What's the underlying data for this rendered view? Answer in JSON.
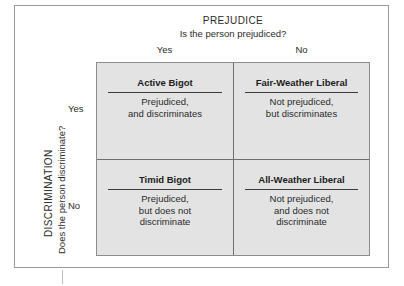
{
  "column_axis": {
    "name": "PREJUDICE",
    "question": "Is the person prejudiced?",
    "values": [
      "Yes",
      "No"
    ]
  },
  "row_axis": {
    "name": "DISCRIMINATION",
    "question": "Does the person discriminate?",
    "values": [
      "Yes",
      "No"
    ]
  },
  "cells": [
    {
      "title": "Active Bigot",
      "description_lines": [
        "Prejudiced,",
        "and discriminates"
      ]
    },
    {
      "title": "Fair-Weather Liberal",
      "description_lines": [
        "Not prejudiced,",
        "but discriminates"
      ]
    },
    {
      "title": "Timid Bigot",
      "description_lines": [
        "Prejudiced,",
        "but does not",
        "discriminate"
      ]
    },
    {
      "title": "All-Weather Liberal",
      "description_lines": [
        "Not prejudiced,",
        "and does not",
        "discriminate"
      ]
    }
  ],
  "colors": {
    "cell_fill": "#e3e3e3",
    "grid_line": "#6f6f6f",
    "frame": "#9a9a9a",
    "text": "#2b2b2b"
  }
}
